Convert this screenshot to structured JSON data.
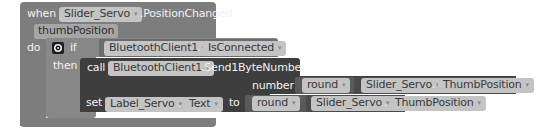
{
  "event_block": {
    "keyword_when": "when",
    "component": "Slider_Servo",
    "event": ".PositionChanged",
    "param": "thumbPosition",
    "keyword_do": "do"
  },
  "if_block": {
    "keyword_if": "if",
    "keyword_then": "then",
    "gear_icon": "gear-icon",
    "condition": {
      "component": "BluetoothClient1",
      "dot": ".",
      "property": "IsConnected"
    }
  },
  "call_block": {
    "keyword_call": "call",
    "component": "BluetoothClient1",
    "method": ".Send1ByteNumber",
    "arg_label": "number",
    "arg": {
      "function": "round",
      "component": "Slider_Servo",
      "dot": ".",
      "property": "ThumbPosition"
    }
  },
  "set_block": {
    "keyword_set": "set",
    "component": "Label_Servo",
    "dot": ".",
    "property": "Text",
    "keyword_to": "to",
    "value": {
      "function": "round",
      "component": "Slider_Servo",
      "dot": ".",
      "property": "ThumbPosition"
    }
  },
  "dropdown_glyph": "▾",
  "colors": {
    "event_block": "#7d7d7d",
    "control_block": "#888888",
    "call_block": "#3e3e3e",
    "component_block": "#5a5a5a",
    "field": "#c4c4c4"
  }
}
